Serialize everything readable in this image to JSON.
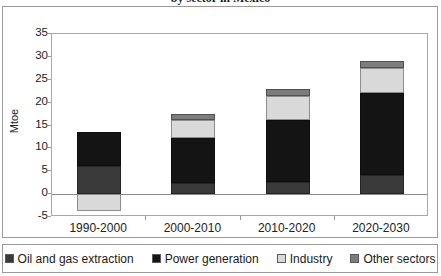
{
  "title": "by sector in Mexico",
  "chart_data": {
    "type": "bar",
    "subtype": "stacked-bar",
    "title": "by sector in Mexico",
    "xlabel": "",
    "ylabel": "Mtoe",
    "ylim": [
      -5,
      35
    ],
    "yticks": [
      -5,
      0,
      5,
      10,
      15,
      20,
      25,
      30,
      35
    ],
    "ytick_labels": [
      "-5",
      "0",
      "5",
      "10",
      "15",
      "20",
      "25",
      "30",
      "35"
    ],
    "grid": false,
    "legend_position": "bottom",
    "categories": [
      "1990-2000",
      "2000-2010",
      "2010-2020",
      "2020-2030"
    ],
    "series": [
      {
        "name": "Oil and gas extraction",
        "color": "#3a3a3a",
        "values": [
          6.2,
          2.5,
          2.7,
          4.1
        ]
      },
      {
        "name": "Power generation",
        "color": "#141414",
        "values": [
          7.4,
          9.7,
          13.6,
          17.9
        ]
      },
      {
        "name": "Industry",
        "color": "#d9d9d9",
        "values": [
          -3.7,
          4.1,
          5.2,
          5.5
        ]
      },
      {
        "name": "Other sectors",
        "color": "#7d7d7d",
        "values": [
          0,
          1.2,
          1.5,
          1.5
        ]
      }
    ],
    "totals": [
      13.6,
      17.5,
      23.0,
      29.0
    ]
  },
  "legend": [
    {
      "label": "Oil and gas extraction",
      "color": "#3a3a3a"
    },
    {
      "label": "Power generation",
      "color": "#141414"
    },
    {
      "label": "Industry",
      "color": "#d9d9d9"
    },
    {
      "label": "Other sectors",
      "color": "#7d7d7d"
    }
  ],
  "colors": {
    "frame": "#9a9a9a",
    "axis": "#a8a8a8",
    "zero_line": "#8d8d8d",
    "background": "#ffffff"
  }
}
